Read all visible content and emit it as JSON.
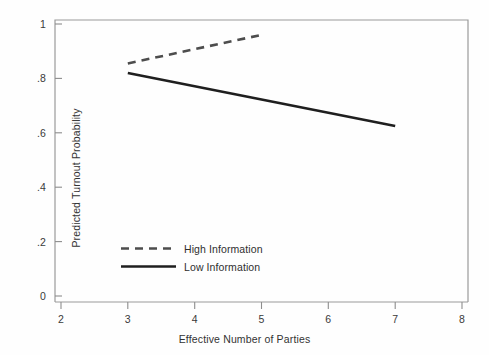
{
  "chart_data": {
    "type": "line",
    "title": "",
    "xlabel": "Effective Number of Parties",
    "ylabel": "Predicted Turnout Probability",
    "xlim": [
      2,
      8
    ],
    "ylim": [
      0,
      1
    ],
    "xticks": [
      "2",
      "3",
      "4",
      "5",
      "6",
      "7",
      "8"
    ],
    "xtick_values": [
      2,
      3,
      4,
      5,
      6,
      7,
      8
    ],
    "yticks": [
      "0",
      ".2",
      ".4",
      ".6",
      ".8",
      "1"
    ],
    "ytick_values": [
      0,
      0.2,
      0.4,
      0.6,
      0.8,
      1
    ],
    "grid": false,
    "legend_position": "center-left",
    "series": [
      {
        "name": "High Information",
        "style": "dashed",
        "color": "#4d4d4d",
        "x": [
          3,
          5
        ],
        "values": [
          0.855,
          0.96
        ]
      },
      {
        "name": "Low Information",
        "style": "solid",
        "color": "#1f1f1f",
        "x": [
          3,
          7
        ],
        "values": [
          0.82,
          0.625
        ]
      }
    ]
  },
  "axes": {
    "x_title": "Effective Number of Parties",
    "y_title": "Predicted Turnout Probability",
    "x_tick_labels": [
      "2",
      "3",
      "4",
      "5",
      "6",
      "7",
      "8"
    ],
    "y_tick_labels": [
      "1",
      ".8",
      ".6",
      ".4",
      ".2",
      "0"
    ]
  },
  "legend": {
    "entries": [
      {
        "label": "High Information",
        "style": "dashed"
      },
      {
        "label": "Low Information",
        "style": "solid"
      }
    ]
  },
  "colors": {
    "frame": "#9a9a9a",
    "solid_line": "#1f1f1f",
    "dashed_line": "#4d4d4d",
    "text": "#333333",
    "background": "#fefefe"
  }
}
